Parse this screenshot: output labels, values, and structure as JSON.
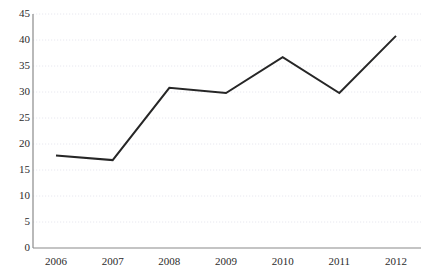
{
  "chart_data": {
    "type": "line",
    "title": "",
    "subtitle": "",
    "xlabel": "",
    "ylabel": "",
    "categories": [
      "2006",
      "2007",
      "2008",
      "2009",
      "2010",
      "2011",
      "2012"
    ],
    "values": [
      17.8,
      16.9,
      30.8,
      29.8,
      36.7,
      29.8,
      40.8
    ],
    "series": [
      {
        "name": "",
        "values": [
          17.8,
          16.9,
          30.8,
          29.8,
          36.7,
          29.8,
          40.8
        ]
      }
    ],
    "ylim": [
      0,
      45
    ],
    "ytick_values": [
      0,
      5,
      10,
      15,
      20,
      25,
      30,
      35,
      40,
      45
    ],
    "ytick_labels": [
      "0",
      "5",
      "10",
      "15",
      "20",
      "25",
      "30",
      "35",
      "40",
      "45"
    ],
    "xtick_labels": [
      "2006",
      "2007",
      "2008",
      "2009",
      "2010",
      "2011",
      "2012"
    ],
    "grid": true,
    "grid_axis": "y",
    "grid_style": "dotted",
    "legend": false,
    "legend_position": "none",
    "markers": false,
    "annotations": [],
    "colors": {
      "line": "#262626",
      "grid": "#e8e8ef",
      "axis": "#808080",
      "text": "#2b2b2b",
      "background": "#ffffff"
    }
  },
  "axes": {
    "y_axis_name": "value-axis",
    "x_axis_name": "year-axis"
  }
}
